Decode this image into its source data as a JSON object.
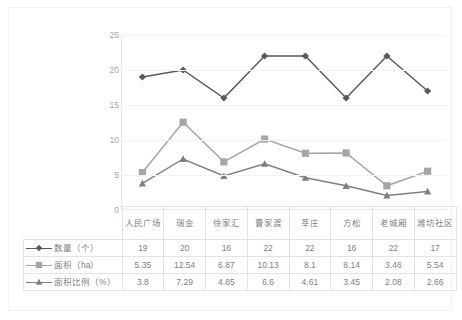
{
  "chart_data": {
    "type": "line",
    "title": "",
    "xlabel": "",
    "ylabel": "",
    "ylim": [
      0,
      25
    ],
    "grid": true,
    "legend_position": "data-table-left",
    "y_ticks": [
      "0",
      "5",
      "10",
      "15",
      "20",
      "25"
    ],
    "categories": [
      "人民广场",
      "瑞金",
      "徐家汇",
      "曹家渡",
      "莘庄",
      "方松",
      "老城厢",
      "潍坊社区"
    ],
    "series": [
      {
        "name": "数量（个）",
        "marker": "diamond",
        "color": "#595959",
        "values": [
          19,
          20,
          16,
          22,
          22,
          16,
          22,
          17
        ],
        "labels": [
          "19",
          "20",
          "16",
          "22",
          "22",
          "16",
          "22",
          "17"
        ]
      },
      {
        "name": "面积（ha）",
        "marker": "square",
        "color": "#a6a6a6",
        "values": [
          5.35,
          12.54,
          6.87,
          10.13,
          8.1,
          8.14,
          3.46,
          5.54
        ],
        "labels": [
          "5.35",
          "12.54",
          "6.87",
          "10.13",
          "8.1",
          "8.14",
          "3.46",
          "5.54"
        ]
      },
      {
        "name": "面积比例（%）",
        "marker": "triangle",
        "color": "#7f7f7f",
        "values": [
          3.8,
          7.29,
          4.85,
          6.6,
          4.61,
          3.45,
          2.08,
          2.66
        ],
        "labels": [
          "3.8",
          "7.29",
          "4.85",
          "6.6",
          "4.61",
          "3.45",
          "2.08",
          "2.66"
        ]
      }
    ]
  },
  "colors": {
    "series_1": "#595959",
    "series_2": "#a6a6a6",
    "series_3": "#7f7f7f",
    "gridline": "#f2f2f2",
    "axis": "#e8e8e8",
    "table_border": "#e3e3e3",
    "text": "#808080",
    "frame": "#f2f2f2"
  }
}
